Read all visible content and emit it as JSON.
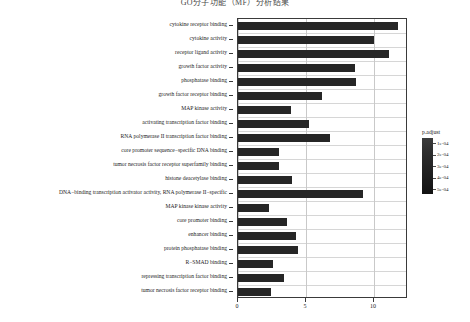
{
  "chart_data": {
    "type": "bar",
    "orientation": "horizontal",
    "title": "GO分子功能（MF）分析结果",
    "xlabel": "",
    "ylabel": "",
    "xlim": [
      0,
      12.5
    ],
    "xticks": [
      0,
      5,
      10
    ],
    "xticklabels": [
      "0",
      "5",
      "10"
    ],
    "grid": true,
    "legend_position": "right",
    "bar_color": "#262626",
    "categories": [
      "cytokine receptor binding",
      "cytokine activity",
      "receptor ligand activity",
      "growth factor activity",
      "phosphatase binding",
      "growth factor receptor binding",
      "MAP kinase activity",
      "activating transcription factor binding",
      "RNA polymerase II transcription factor binding",
      "core promoter sequence−specific DNA binding",
      "tumor necrosis factor receptor superfamily binding",
      "histone deacetylase binding",
      "DNA−binding transcription activator activity, RNA polymerase II−specific",
      "MAP kinase kinase activity",
      "core promoter binding",
      "enhancer binding",
      "protein phosphatase binding",
      "R−SMAD binding",
      "repressing transcription factor binding",
      "tumor necrosis factor receptor binding"
    ],
    "values": [
      11.8,
      10.0,
      11.1,
      8.6,
      8.7,
      6.2,
      3.9,
      5.2,
      6.8,
      3.0,
      3.0,
      4.0,
      9.2,
      2.3,
      3.6,
      4.3,
      4.4,
      2.6,
      3.4,
      2.4
    ],
    "value_axis_note": "count"
  },
  "axis": {
    "x_tick_labels": [
      "0",
      "5",
      "10"
    ]
  },
  "legend": {
    "title": "p.adjust",
    "ticks": [
      "1e-04",
      "2e-04",
      "3e-04",
      "4e-04",
      "5e-04"
    ],
    "gradient_top": "#3c3c3c",
    "gradient_bottom": "#121212"
  }
}
